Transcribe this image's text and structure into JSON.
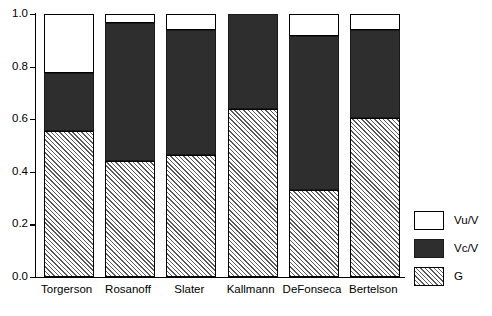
{
  "chart_data": {
    "type": "bar",
    "stacked": true,
    "title": "",
    "subtitle": "",
    "xlabel": "",
    "ylabel": "",
    "ylim": [
      0.0,
      1.0
    ],
    "grid": false,
    "legend_position": "right",
    "categories": [
      "Torgerson",
      "Rosanoff",
      "Slater",
      "Kallmann",
      "DeFonseca",
      "Bertelson"
    ],
    "y_ticks": [
      0.0,
      0.2,
      0.4,
      0.6,
      0.8,
      1.0
    ],
    "y_tick_labels": [
      "0.0",
      "0.2",
      "0.4",
      "0.6",
      "0.8",
      "1.0"
    ],
    "series": [
      {
        "name": "G",
        "fill": "hatched-diagonal",
        "color": "#5a5a5a",
        "values": [
          0.555,
          0.44,
          0.465,
          0.64,
          0.33,
          0.605
        ]
      },
      {
        "name": "Vc/V",
        "fill": "solid-dark",
        "color": "#2e2e2e",
        "values": [
          0.22,
          0.525,
          0.475,
          0.36,
          0.585,
          0.335
        ]
      },
      {
        "name": "Vu/V",
        "fill": "solid-white",
        "color": "#ffffff",
        "values": [
          0.225,
          0.035,
          0.06,
          0.0,
          0.085,
          0.06
        ]
      }
    ],
    "cumulative_tops": {
      "G": [
        0.555,
        0.44,
        0.465,
        0.64,
        0.33,
        0.605
      ],
      "G_plus_Vc": [
        0.775,
        0.965,
        0.94,
        1.0,
        0.915,
        0.94
      ],
      "total": [
        1.0,
        1.0,
        1.0,
        1.0,
        1.0,
        1.0
      ]
    }
  },
  "legend": {
    "items": [
      {
        "label": "Vu/V",
        "swatch": "white-swatch"
      },
      {
        "label": "Vc/V",
        "swatch": "dark-swatch"
      },
      {
        "label": "G",
        "swatch": "hatched-swatch"
      }
    ]
  }
}
